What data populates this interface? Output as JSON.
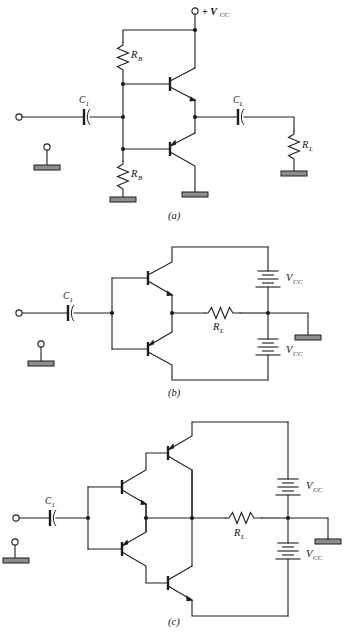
{
  "figure": {
    "panels": [
      {
        "id": "a",
        "caption": "(a)",
        "description": "Single-supply complementary-symmetry output stage with base-bias resistors and output coupling capacitor",
        "supply_label": "+ V",
        "supply_sub": "CC",
        "components": [
          {
            "name": "C1",
            "label": "C",
            "sub": "1",
            "type": "capacitor",
            "role": "input-coupling"
          },
          {
            "name": "RB1",
            "label": "R",
            "sub": "B",
            "type": "resistor",
            "role": "upper-bias"
          },
          {
            "name": "RB2",
            "label": "R",
            "sub": "B",
            "type": "resistor",
            "role": "lower-bias"
          },
          {
            "name": "CL",
            "label": "C",
            "sub": "L",
            "type": "capacitor",
            "role": "output-coupling"
          },
          {
            "name": "RL",
            "label": "R",
            "sub": "L",
            "type": "resistor",
            "role": "load"
          },
          {
            "name": "Q1",
            "label": "",
            "sub": "",
            "type": "npn-transistor",
            "role": "upper-output"
          },
          {
            "name": "Q2",
            "label": "",
            "sub": "",
            "type": "pnp-transistor",
            "role": "lower-output"
          }
        ]
      },
      {
        "id": "b",
        "caption": "(b)",
        "description": "Dual-supply complementary-symmetry output stage driving load directly",
        "components": [
          {
            "name": "C1",
            "label": "C",
            "sub": "1",
            "type": "capacitor",
            "role": "input-coupling"
          },
          {
            "name": "RL",
            "label": "R",
            "sub": "L",
            "type": "resistor",
            "role": "load"
          },
          {
            "name": "VCC_P",
            "label": "V",
            "sub": "CC",
            "type": "battery",
            "role": "positive-supply"
          },
          {
            "name": "VCC_N",
            "label": "V",
            "sub": "CC",
            "type": "battery",
            "role": "negative-supply"
          },
          {
            "name": "Q1",
            "label": "",
            "sub": "",
            "type": "npn-transistor",
            "role": "upper-output"
          },
          {
            "name": "Q2",
            "label": "",
            "sub": "",
            "type": "pnp-transistor",
            "role": "lower-output"
          }
        ]
      },
      {
        "id": "c",
        "caption": "(c)",
        "description": "Dual-supply quasi-complementary Darlington output stage with four transistors",
        "components": [
          {
            "name": "C1",
            "label": "C",
            "sub": "1",
            "type": "capacitor",
            "role": "input-coupling"
          },
          {
            "name": "RL",
            "label": "R",
            "sub": "L",
            "type": "resistor",
            "role": "load"
          },
          {
            "name": "VCC_P",
            "label": "V",
            "sub": "CC",
            "type": "battery",
            "role": "positive-supply"
          },
          {
            "name": "VCC_N",
            "label": "V",
            "sub": "CC",
            "type": "battery",
            "role": "negative-supply"
          },
          {
            "name": "Q1",
            "label": "",
            "sub": "",
            "type": "npn-transistor",
            "role": "upper-driver"
          },
          {
            "name": "Q2",
            "label": "",
            "sub": "",
            "type": "pnp-transistor",
            "role": "upper-output"
          },
          {
            "name": "Q3",
            "label": "",
            "sub": "",
            "type": "pnp-transistor",
            "role": "lower-driver"
          },
          {
            "name": "Q4",
            "label": "",
            "sub": "",
            "type": "npn-transistor",
            "role": "lower-output"
          }
        ]
      }
    ],
    "symbols": {
      "ground": "ground-hatched-plate",
      "terminal": "open-circle-terminal",
      "node": "solid-junction-dot",
      "battery": "multi-cell-battery"
    },
    "colors": {
      "line": "#1d1d1d",
      "ground_fill": "#8e8e8e",
      "background": "#ffffff",
      "text": "#111111"
    }
  }
}
